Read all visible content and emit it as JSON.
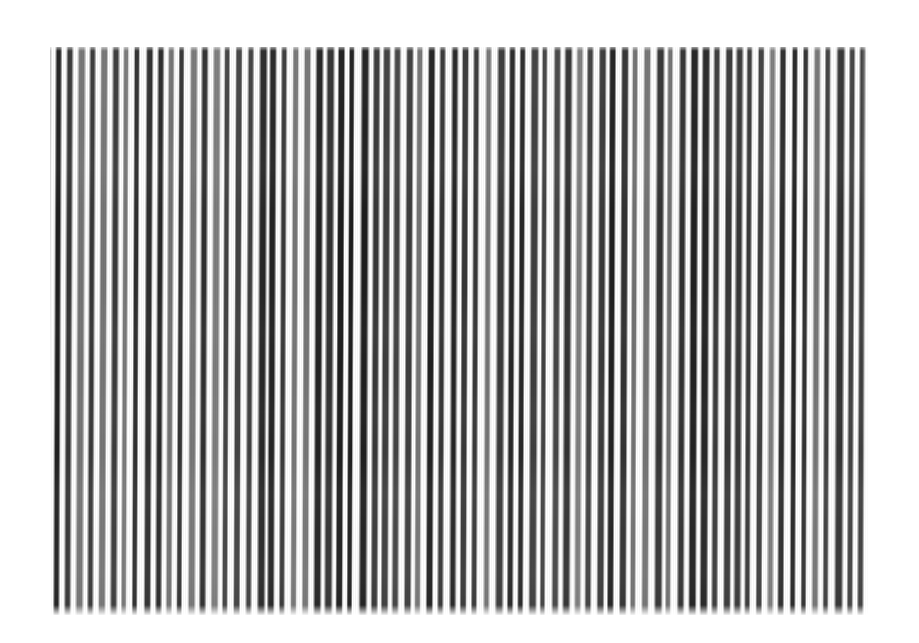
{
  "image": {
    "kind": "photograph",
    "subject": "vertical black and white stripe pattern",
    "alt_text": "Photograph of a dense field of vertical black and white stripes filling a rectangular region on a white background",
    "canvas": {
      "width": 919,
      "height": 643,
      "background_color": "#ffffff"
    },
    "panel": {
      "left": 50,
      "top": 47,
      "width": 818,
      "height": 568,
      "description": "rectangular striped region"
    },
    "stripes": {
      "orientation": "vertical",
      "period_px": 11.3,
      "approximate_count": 72,
      "dark_color": "#1a1a1a",
      "light_color": "#ffffff",
      "edge_softness": "gradient",
      "waviness": "slight horizontal drift over height",
      "darkness_variation": "cores range from near-black to mid-gray"
    },
    "colors": {
      "background": "#ffffff",
      "stripe_dark": "#1a1a1a",
      "stripe_mid": "#6e6e6e",
      "stripe_light": "#ffffff"
    }
  }
}
